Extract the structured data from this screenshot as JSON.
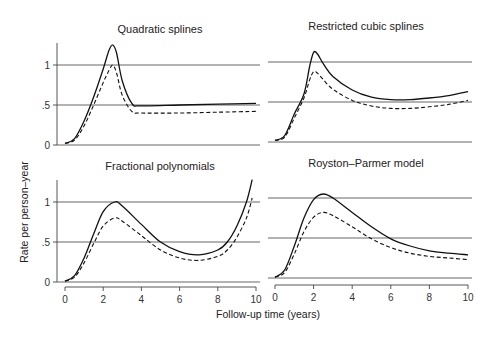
{
  "chart_data": [
    {
      "type": "line",
      "title": "Quadratic splines",
      "xlabel": "Follow-up time (years)",
      "ylabel": "Rate per person-year",
      "xlim": [
        0,
        10
      ],
      "ylim": [
        0,
        1.3
      ],
      "series": [
        {
          "name": "solid",
          "x": [
            0,
            0.5,
            1,
            1.5,
            2,
            2.3,
            2.5,
            2.7,
            3,
            3.5,
            4,
            6,
            8,
            10
          ],
          "values": [
            0.02,
            0.08,
            0.3,
            0.6,
            0.95,
            1.18,
            1.25,
            1.15,
            0.8,
            0.52,
            0.49,
            0.5,
            0.51,
            0.52
          ]
        },
        {
          "name": "dashed",
          "x": [
            0,
            0.5,
            1,
            1.5,
            2,
            2.3,
            2.5,
            2.7,
            3,
            3.5,
            4,
            6,
            8,
            10
          ],
          "values": [
            0.02,
            0.06,
            0.24,
            0.5,
            0.78,
            0.93,
            1.0,
            0.9,
            0.62,
            0.42,
            0.4,
            0.4,
            0.41,
            0.42
          ]
        }
      ]
    },
    {
      "type": "line",
      "title": "Restricted cubic splines",
      "xlabel": "Follow-up time (years)",
      "ylabel": "Rate per person-year",
      "xlim": [
        0,
        10
      ],
      "ylim": [
        0,
        1.3
      ],
      "series": [
        {
          "name": "solid",
          "x": [
            0,
            0.5,
            1,
            1.5,
            1.8,
            2,
            2.2,
            2.5,
            3,
            4,
            5,
            6,
            7,
            8,
            9,
            10
          ],
          "values": [
            0.02,
            0.08,
            0.35,
            0.6,
            0.95,
            1.12,
            1.1,
            0.98,
            0.82,
            0.65,
            0.56,
            0.53,
            0.53,
            0.55,
            0.58,
            0.63
          ]
        },
        {
          "name": "dashed",
          "x": [
            0,
            0.5,
            1,
            1.5,
            1.8,
            2,
            2.2,
            2.5,
            3,
            4,
            5,
            6,
            7,
            8,
            9,
            10
          ],
          "values": [
            0.02,
            0.06,
            0.3,
            0.55,
            0.78,
            0.88,
            0.86,
            0.78,
            0.66,
            0.52,
            0.45,
            0.42,
            0.42,
            0.44,
            0.47,
            0.52
          ]
        }
      ]
    },
    {
      "type": "line",
      "title": "Fractional polynomials",
      "xlabel": "Follow-up time (years)",
      "ylabel": "Rate per person-year",
      "xlim": [
        0,
        10
      ],
      "ylim": [
        0,
        1.3
      ],
      "series": [
        {
          "name": "solid",
          "x": [
            0,
            0.5,
            1,
            1.5,
            2,
            2.6,
            3,
            4,
            5,
            6,
            7,
            8,
            8.5,
            9,
            9.5,
            9.8
          ],
          "values": [
            0.01,
            0.08,
            0.3,
            0.6,
            0.88,
            1.0,
            0.95,
            0.72,
            0.5,
            0.38,
            0.34,
            0.4,
            0.5,
            0.7,
            1.0,
            1.28
          ]
        },
        {
          "name": "dashed",
          "x": [
            0,
            0.5,
            1,
            1.5,
            2,
            2.6,
            3,
            4,
            5,
            6,
            7,
            8,
            8.5,
            9,
            9.5,
            9.8
          ],
          "values": [
            0.01,
            0.06,
            0.24,
            0.48,
            0.7,
            0.8,
            0.76,
            0.58,
            0.4,
            0.3,
            0.27,
            0.32,
            0.4,
            0.56,
            0.8,
            1.05
          ]
        }
      ]
    },
    {
      "type": "line",
      "title": "Royston-Parmer model",
      "xlabel": "Follow-up time (years)",
      "ylabel": "Rate per person-year",
      "xlim": [
        0,
        10
      ],
      "ylim": [
        0,
        1.3
      ],
      "series": [
        {
          "name": "solid",
          "x": [
            0,
            0.5,
            1,
            1.5,
            2,
            2.5,
            3,
            4,
            5,
            6,
            7,
            8,
            9,
            10
          ],
          "values": [
            0.01,
            0.1,
            0.4,
            0.75,
            0.98,
            1.05,
            1.0,
            0.82,
            0.64,
            0.49,
            0.4,
            0.34,
            0.31,
            0.29
          ]
        },
        {
          "name": "dashed",
          "x": [
            0,
            0.5,
            1,
            1.5,
            2,
            2.5,
            3,
            4,
            5,
            6,
            7,
            8,
            9,
            10
          ],
          "values": [
            0.01,
            0.07,
            0.3,
            0.58,
            0.76,
            0.82,
            0.78,
            0.64,
            0.49,
            0.38,
            0.31,
            0.27,
            0.25,
            0.23
          ]
        }
      ]
    }
  ],
  "labels": {
    "ylabel": "Rate per person–year",
    "xlabel": "Follow-up time (years)",
    "titles": [
      "Quadratic splines",
      "Restricted cubic splines",
      "Fractional polynomials",
      "Royston–Parmer model"
    ],
    "yticks": [
      "0",
      ".5",
      "1"
    ],
    "xticks": [
      "0",
      "2",
      "4",
      "6",
      "8",
      "10"
    ]
  }
}
